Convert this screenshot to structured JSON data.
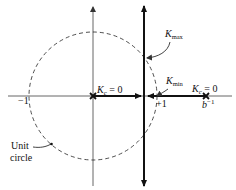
{
  "diagram": {
    "type": "root-locus",
    "colors": {
      "line": "#111111",
      "axis": "#555555",
      "background": "#ffffff"
    },
    "axes": {
      "real_axis": {
        "neg_label": "−1",
        "pos_label": "+1"
      }
    },
    "unit_circle": {
      "label_line1": "Unit",
      "label_line2": "circle"
    },
    "poles": [
      {
        "label_k": "K",
        "label_sub": "c",
        "label_rest": " = 0"
      },
      {
        "label_k": "K",
        "label_sub": "c",
        "label_rest": " = 0",
        "position_label_base": "b",
        "position_label_sup": "−1"
      }
    ],
    "annotations": {
      "kmax": {
        "k": "K",
        "sub": "max"
      },
      "kmin": {
        "k": "K",
        "sub": "min"
      }
    }
  }
}
